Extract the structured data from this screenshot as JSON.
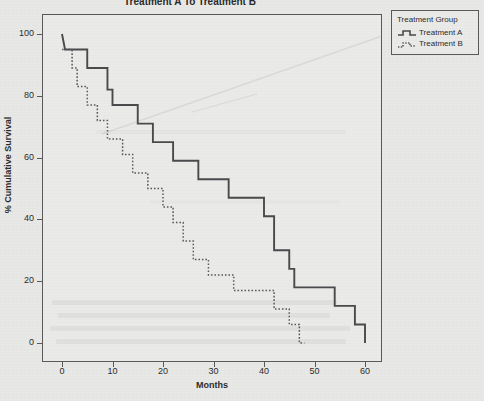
{
  "chart_data": {
    "type": "line",
    "title": "Treatment A To Treatment B",
    "xlabel": "Months",
    "ylabel": "% Cumulative Survival",
    "xlim": [
      0,
      63
    ],
    "ylim": [
      0,
      105
    ],
    "xticks": [
      0,
      10,
      20,
      30,
      40,
      50,
      60
    ],
    "xtick_labels": [
      "0",
      "10",
      "20",
      "30",
      "40",
      "50",
      "60"
    ],
    "yticks": [
      0,
      20,
      40,
      60,
      80,
      100
    ],
    "ytick_labels": [
      "0",
      "20",
      "40",
      "60",
      "80",
      "100"
    ],
    "grid": false,
    "legend_position": "right-outside",
    "legend_title": "Treatment Group",
    "plot_style": "kaplan-meier-step",
    "series": [
      {
        "name": "Treatment A",
        "linestyle": "solid",
        "color": "#4a4a4d",
        "points": [
          [
            0,
            100
          ],
          [
            0.6,
            95
          ],
          [
            5,
            95
          ],
          [
            5,
            89
          ],
          [
            9,
            89
          ],
          [
            9,
            82
          ],
          [
            10,
            82
          ],
          [
            10,
            77
          ],
          [
            15,
            77
          ],
          [
            15,
            71
          ],
          [
            18,
            71
          ],
          [
            18,
            65
          ],
          [
            22,
            65
          ],
          [
            22,
            59
          ],
          [
            27,
            59
          ],
          [
            27,
            53
          ],
          [
            33,
            53
          ],
          [
            33,
            47
          ],
          [
            40,
            47
          ],
          [
            40,
            41
          ],
          [
            42,
            41
          ],
          [
            42,
            30
          ],
          [
            45,
            30
          ],
          [
            45,
            24
          ],
          [
            46,
            24
          ],
          [
            46,
            18
          ],
          [
            54,
            18
          ],
          [
            54,
            12
          ],
          [
            58,
            12
          ],
          [
            58,
            6
          ],
          [
            60,
            6
          ],
          [
            60,
            0
          ]
        ]
      },
      {
        "name": "Treatment B",
        "linestyle": "dotted",
        "color": "#5a5a5d",
        "points": [
          [
            0,
            95
          ],
          [
            2,
            95
          ],
          [
            2,
            89
          ],
          [
            3,
            89
          ],
          [
            3,
            83
          ],
          [
            5,
            83
          ],
          [
            5,
            77
          ],
          [
            7,
            77
          ],
          [
            7,
            72
          ],
          [
            9,
            72
          ],
          [
            9,
            66
          ],
          [
            12,
            66
          ],
          [
            12,
            61
          ],
          [
            14,
            61
          ],
          [
            14,
            55
          ],
          [
            17,
            55
          ],
          [
            17,
            50
          ],
          [
            20,
            50
          ],
          [
            20,
            44
          ],
          [
            22,
            44
          ],
          [
            22,
            39
          ],
          [
            24,
            39
          ],
          [
            24,
            33
          ],
          [
            26,
            33
          ],
          [
            26,
            27
          ],
          [
            29,
            27
          ],
          [
            29,
            22
          ],
          [
            34,
            22
          ],
          [
            34,
            17
          ],
          [
            42,
            17
          ],
          [
            42,
            11
          ],
          [
            45,
            11
          ],
          [
            45,
            6
          ],
          [
            47,
            6
          ],
          [
            47,
            0
          ],
          [
            48,
            0
          ]
        ]
      }
    ]
  },
  "legend": {
    "title": "Treatment Group",
    "entries": [
      {
        "label": "Treatment A",
        "key": "solid-step-line"
      },
      {
        "label": "Treatment B",
        "key": "dotted-step-line"
      }
    ]
  },
  "colors": {
    "background": "#e8e8e6",
    "axis": "#59595c",
    "text": "#2c2c2c",
    "series_a": "#4a4a4d",
    "series_b": "#5a5a5d"
  }
}
